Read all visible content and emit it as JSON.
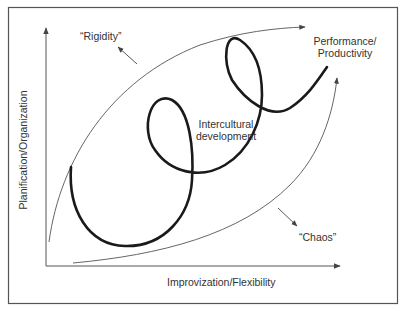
{
  "diagram": {
    "axes": {
      "y_label": "Planification/Organization",
      "x_label": "Improvization/Flexibility"
    },
    "labels": {
      "rigidity": "“Rigidity”",
      "chaos": "“Chaos”",
      "performance_line1": "Performance/",
      "performance_line2": "Productivity",
      "intercultural_line1": "Intercultural",
      "intercultural_line2": "development"
    },
    "colors": {
      "frame": "#555555",
      "thin_line": "#555555",
      "spiral": "#1a1a1a",
      "text": "#333333"
    }
  }
}
